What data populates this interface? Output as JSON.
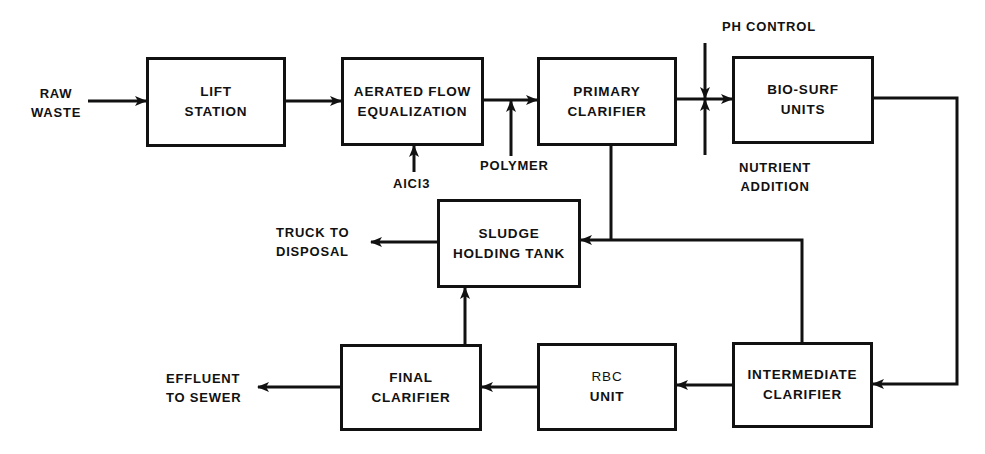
{
  "diagram": {
    "type": "process-flow",
    "title": "",
    "colors": {
      "line": "#111111",
      "background": "#ffffff"
    },
    "nodes": {
      "lift_station": {
        "line1": "LIFT",
        "line2": "STATION"
      },
      "aerated_flow_equalization": {
        "line1": "AERATED FLOW",
        "line2": "EQUALIZATION"
      },
      "primary_clarifier": {
        "line1": "PRIMARY",
        "line2": "CLARIFIER"
      },
      "bio_surf_units": {
        "line1": "BIO-SURF",
        "line2": "UNITS"
      },
      "sludge_holding_tank": {
        "line1": "SLUDGE",
        "line2": "HOLDING TANK"
      },
      "final_clarifier": {
        "line1": "FINAL",
        "line2": "CLARIFIER"
      },
      "rbc_unit": {
        "line1": "RBC",
        "line2": "UNIT"
      },
      "intermediate_clarifier": {
        "line1": "INTERMEDIATE",
        "line2": "CLARIFIER"
      }
    },
    "labels": {
      "raw_waste": {
        "line1": "RAW",
        "line2": "WASTE"
      },
      "alcl3": "AlCl3",
      "polymer": "POLYMER",
      "ph_control": "PH CONTROL",
      "nutrient_addition": {
        "line1": "NUTRIENT",
        "line2": "ADDITION"
      },
      "truck_to_disposal": {
        "line1": "TRUCK TO",
        "line2": "DISPOSAL"
      },
      "effluent_to_sewer": {
        "line1": "EFFLUENT",
        "line2": "TO SEWER"
      }
    },
    "edges": [
      {
        "from": "RAW WASTE",
        "to": "LIFT STATION"
      },
      {
        "from": "LIFT STATION",
        "to": "AERATED FLOW EQUALIZATION"
      },
      {
        "from": "AlCl3",
        "to": "AERATED FLOW EQUALIZATION"
      },
      {
        "from": "AERATED FLOW EQUALIZATION",
        "to": "PRIMARY CLARIFIER"
      },
      {
        "from": "POLYMER",
        "to": "PRIMARY CLARIFIER"
      },
      {
        "from": "PRIMARY CLARIFIER",
        "to": "BIO-SURF UNITS"
      },
      {
        "from": "PH CONTROL",
        "to": "BIO-SURF UNITS"
      },
      {
        "from": "NUTRIENT ADDITION",
        "to": "BIO-SURF UNITS"
      },
      {
        "from": "BIO-SURF UNITS",
        "to": "INTERMEDIATE CLARIFIER"
      },
      {
        "from": "PRIMARY CLARIFIER",
        "to": "SLUDGE HOLDING TANK"
      },
      {
        "from": "INTERMEDIATE CLARIFIER",
        "to": "SLUDGE HOLDING TANK"
      },
      {
        "from": "INTERMEDIATE CLARIFIER",
        "to": "RBC UNIT"
      },
      {
        "from": "RBC UNIT",
        "to": "FINAL CLARIFIER"
      },
      {
        "from": "FINAL CLARIFIER",
        "to": "SLUDGE HOLDING TANK"
      },
      {
        "from": "FINAL CLARIFIER",
        "to": "EFFLUENT TO SEWER"
      },
      {
        "from": "SLUDGE HOLDING TANK",
        "to": "TRUCK TO DISPOSAL"
      }
    ]
  }
}
